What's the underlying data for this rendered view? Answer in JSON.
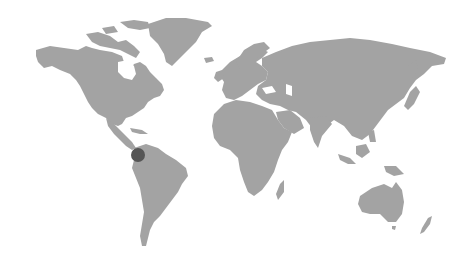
{
  "map": {
    "style": "grey-world-map",
    "land_color": "#a3a3a3",
    "background_color": "#ffffff",
    "markers": [
      {
        "id": "marker-colombia",
        "region": "Colombia",
        "x": 138,
        "y": 155,
        "radius": 7,
        "color": "#555555"
      }
    ]
  }
}
